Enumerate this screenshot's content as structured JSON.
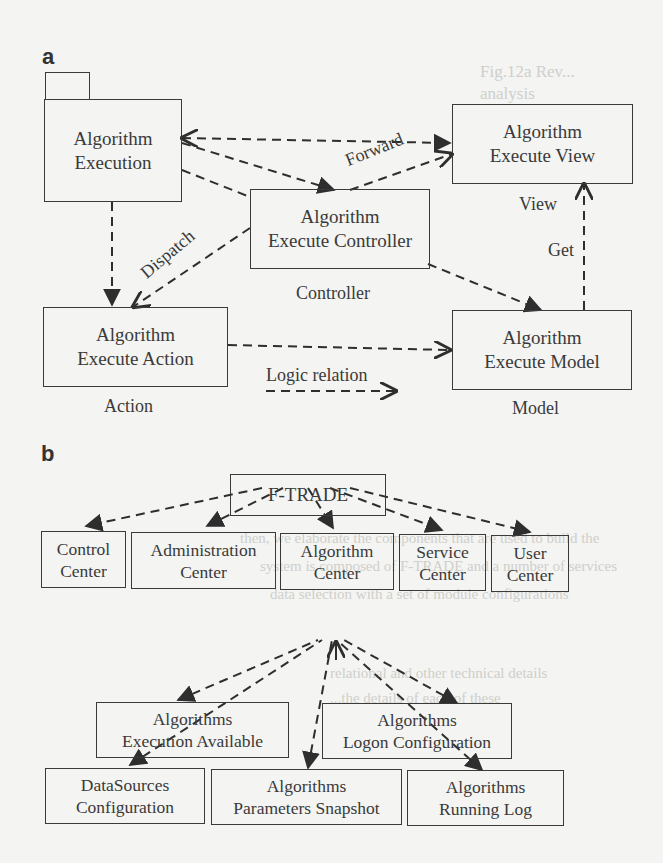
{
  "figure": {
    "panel_a": {
      "letter": "a",
      "nodes": {
        "execution": {
          "line1": "Algorithm",
          "line2": "Execution"
        },
        "view": {
          "line1": "Algorithm",
          "line2": "Execute View"
        },
        "controller": {
          "line1": "Algorithm",
          "line2": "Execute Controller"
        },
        "action": {
          "line1": "Algorithm",
          "line2": "Execute Action"
        },
        "model": {
          "line1": "Algorithm",
          "line2": "Execute Model"
        }
      },
      "edge_labels": {
        "forward": "Forward",
        "dispatch": "Dispatch",
        "view": "View",
        "get": "Get"
      },
      "captions": {
        "controller": "Controller",
        "action": "Action",
        "model": "Model",
        "legend": "Logic relation"
      }
    },
    "panel_b": {
      "letter": "b",
      "root": {
        "label": "F-TRADE"
      },
      "centers": [
        {
          "line1": "Control",
          "line2": "Center"
        },
        {
          "line1": "Administration",
          "line2": "Center"
        },
        {
          "line1": "Algorithm",
          "line2": "Center"
        },
        {
          "line1": "Service",
          "line2": "Center"
        },
        {
          "line1": "User",
          "line2": "Center"
        }
      ],
      "algorithm_children": [
        {
          "line1": "Algorithms",
          "line2": "Execution Available"
        },
        {
          "line1": "Algorithms",
          "line2": "Logon Configuration"
        },
        {
          "line1": "DataSources",
          "line2": "Configuration"
        },
        {
          "line1": "Algorithms",
          "line2": "Parameters Snapshot"
        },
        {
          "line1": "Algorithms",
          "line2": "Running Log"
        }
      ]
    }
  },
  "bleed_through_text": [
    "Fig.12a Rev...",
    "analysis",
    "then, we elaborate the components that are used to build the",
    "system is composed of F-TRADE and a number of services",
    "data selection with a set of module configurations",
    "relational and other technical details",
    "...the details of each of these"
  ]
}
